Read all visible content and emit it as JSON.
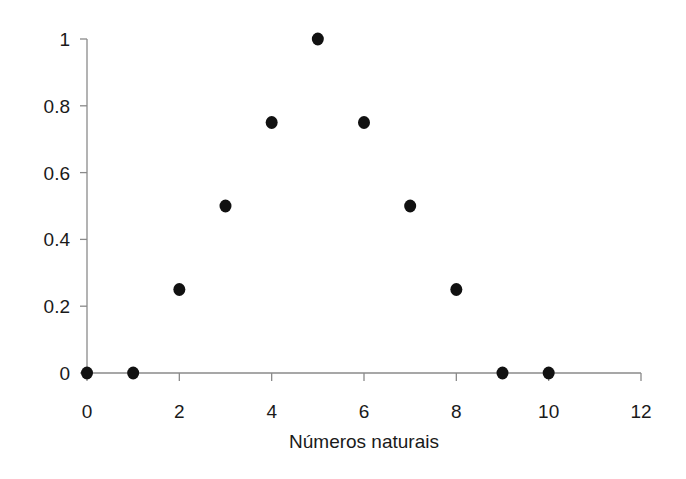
{
  "chart_data": {
    "type": "scatter",
    "title": "",
    "xlabel": "Números naturais",
    "ylabel": "",
    "xlim": [
      0,
      12
    ],
    "ylim": [
      0,
      1
    ],
    "x_ticks": [
      0,
      2,
      4,
      6,
      8,
      10,
      12
    ],
    "y_ticks": [
      0,
      0.2,
      0.4,
      0.6,
      0.8,
      1
    ],
    "x_tick_labels": [
      "0",
      "2",
      "4",
      "6",
      "8",
      "10",
      "12"
    ],
    "y_tick_labels": [
      "0",
      "0.2",
      "0.4",
      "0.6",
      "0.8",
      "1"
    ],
    "grid": false,
    "legend": null,
    "series": [
      {
        "name": "",
        "marker": "circle",
        "color": "#111111",
        "x": [
          0,
          1,
          2,
          3,
          4,
          5,
          6,
          7,
          8,
          9,
          10
        ],
        "y": [
          0,
          0,
          0.25,
          0.5,
          0.75,
          1,
          0.75,
          0.5,
          0.25,
          0,
          0
        ]
      }
    ]
  }
}
